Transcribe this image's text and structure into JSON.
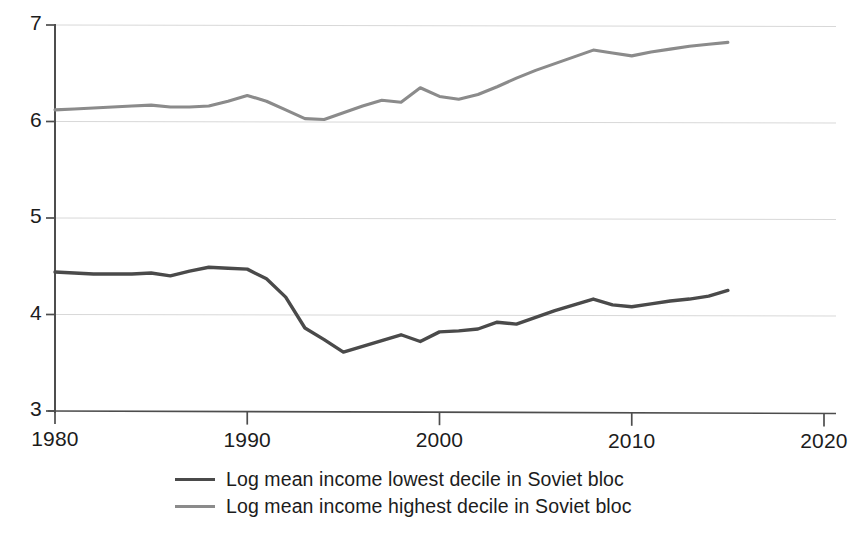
{
  "chart_data": {
    "type": "line",
    "title": "",
    "xlabel": "",
    "ylabel": "",
    "xlim": [
      1980,
      2020
    ],
    "ylim": [
      3,
      7
    ],
    "grid": true,
    "grid_axis": "y",
    "legend_position": "bottom",
    "xticks": [
      1980,
      1990,
      2000,
      2010,
      2020
    ],
    "yticks": [
      3,
      4,
      5,
      6,
      7
    ],
    "xtick_labels": [
      "1980",
      "1990",
      "2000",
      "2010",
      "2020"
    ],
    "ytick_labels": [
      "3",
      "4",
      "5",
      "6",
      "7"
    ],
    "x": [
      1980,
      1981,
      1982,
      1983,
      1984,
      1985,
      1986,
      1987,
      1988,
      1989,
      1990,
      1991,
      1992,
      1993,
      1994,
      1995,
      1996,
      1997,
      1998,
      1999,
      2000,
      2001,
      2002,
      2003,
      2004,
      2005,
      2006,
      2007,
      2008,
      2009,
      2010,
      2011,
      2012,
      2013,
      2014,
      2015
    ],
    "series": [
      {
        "name": "Log mean income lowest decile in Soviet bloc",
        "color": "#4a4a4a",
        "values": [
          4.44,
          4.43,
          4.42,
          4.42,
          4.42,
          4.43,
          4.4,
          4.45,
          4.49,
          4.48,
          4.47,
          4.37,
          4.18,
          3.86,
          3.74,
          3.61,
          3.67,
          3.73,
          3.79,
          3.72,
          3.82,
          3.83,
          3.85,
          3.92,
          3.9,
          3.97,
          4.04,
          4.1,
          4.16,
          4.1,
          4.08,
          4.11,
          4.14,
          4.16,
          4.19,
          4.25
        ]
      },
      {
        "name": "Log mean income highest decile in Soviet bloc",
        "color": "#8b8b8b",
        "values": [
          6.12,
          6.13,
          6.14,
          6.15,
          6.16,
          6.17,
          6.15,
          6.15,
          6.16,
          6.21,
          6.27,
          6.21,
          6.12,
          6.03,
          6.02,
          6.09,
          6.16,
          6.22,
          6.2,
          6.35,
          6.26,
          6.23,
          6.28,
          6.36,
          6.45,
          6.53,
          6.6,
          6.67,
          6.74,
          6.71,
          6.68,
          6.72,
          6.75,
          6.78,
          6.8,
          6.82
        ]
      }
    ]
  },
  "legend": {
    "items": [
      {
        "label": "Log mean income lowest decile in Soviet bloc",
        "color": "#4a4a4a"
      },
      {
        "label": "Log mean income highest decile in Soviet bloc",
        "color": "#8b8b8b"
      }
    ]
  },
  "axes": {
    "axis_color": "#4d4d4d",
    "grid_color": "#d8d8d8",
    "tick_label_color": "#1c1c1c"
  }
}
